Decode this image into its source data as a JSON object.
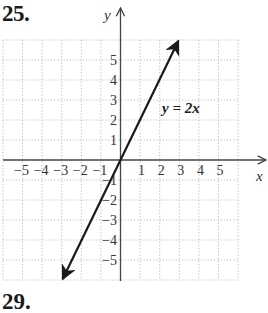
{
  "problem": {
    "number": "25.",
    "next_number": "29.",
    "next_partial_label": "y↑"
  },
  "chart_data": {
    "type": "line",
    "title": "25.",
    "equation_label": "y = 2x",
    "xlabel": "x",
    "ylabel": "y",
    "xlim": [
      -6,
      6
    ],
    "ylim": [
      -6,
      6
    ],
    "grid": true,
    "grid_style": "dotted",
    "x_tick_labels": [
      "−5",
      "−4",
      "−3",
      "−2",
      "−1",
      "1",
      "2",
      "3",
      "4",
      "5"
    ],
    "y_tick_labels": [
      "5",
      "4",
      "3",
      "2",
      "1",
      "−1",
      "−2",
      "−3",
      "−4",
      "−5"
    ],
    "series": [
      {
        "name": "y = 2x",
        "x": [
          -3,
          3
        ],
        "y": [
          -6,
          6
        ],
        "arrows_both_ends": true
      }
    ],
    "colors": {
      "line": "#1a1a1a",
      "axis": "#444444",
      "grid": "#bbbbbb"
    }
  }
}
